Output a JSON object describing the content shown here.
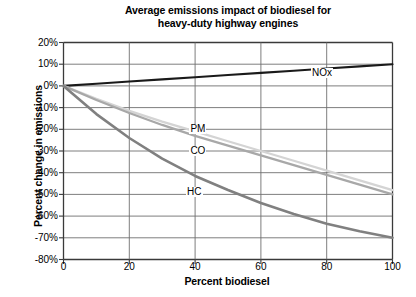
{
  "chart_data": {
    "type": "line",
    "title": "Average emissions impact of biodiesel for heavy-duty highway engines",
    "title_lines": [
      "Average emissions impact of biodiesel for",
      "heavy-duty highway engines"
    ],
    "xlabel": "Percent biodiesel",
    "ylabel": "Percent change in emissions",
    "xlim": [
      0,
      100
    ],
    "ylim": [
      -80,
      20
    ],
    "xticks": [
      0,
      20,
      40,
      60,
      80,
      100
    ],
    "xtick_labels": [
      "0",
      "20",
      "40",
      "60",
      "80",
      "100"
    ],
    "yticks": [
      20,
      10,
      0,
      -10,
      -20,
      -30,
      -40,
      -50,
      -60,
      -70,
      -80
    ],
    "ytick_labels": [
      "20%",
      "10%",
      "0%",
      "-10%",
      "-20%",
      "-30%",
      "-40%",
      "-50%",
      "-60%",
      "-70%",
      "-80%"
    ],
    "grid": true,
    "legend_position": "inline-labels",
    "x": [
      0,
      10,
      20,
      30,
      40,
      50,
      60,
      70,
      80,
      90,
      100
    ],
    "series": [
      {
        "name": "NOx",
        "color": "#1a1a1a",
        "width": 2.1,
        "label_x": 78,
        "label_y": 6,
        "values": [
          0,
          1,
          2,
          3,
          4,
          5,
          6,
          7,
          8,
          9,
          10
        ]
      },
      {
        "name": "PM",
        "color": "#d4d4d4",
        "width": 2.3,
        "label_x": 41,
        "label_y": -20,
        "values": [
          0,
          -6,
          -11.5,
          -16.5,
          -21,
          -25.5,
          -30,
          -34.5,
          -39,
          -43.5,
          -48
        ]
      },
      {
        "name": "CO",
        "color": "#a8a8a8",
        "width": 2.3,
        "label_x": 41,
        "label_y": -30,
        "values": [
          0,
          -6.5,
          -12.5,
          -18,
          -23,
          -27.5,
          -32,
          -36.5,
          -41,
          -45.5,
          -50
        ]
      },
      {
        "name": "HC",
        "color": "#808080",
        "width": 2.6,
        "label_x": 40,
        "label_y": -49,
        "values": [
          0,
          -13,
          -24,
          -33.5,
          -41.5,
          -48,
          -54,
          -59,
          -63.5,
          -67,
          -70
        ]
      }
    ]
  }
}
